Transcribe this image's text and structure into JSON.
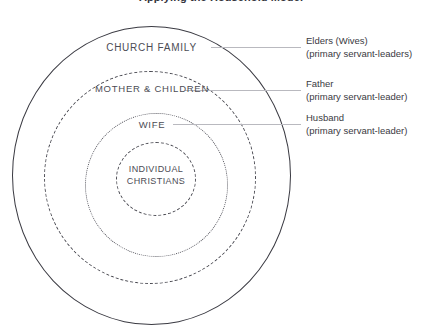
{
  "title": "Applying the Household Model",
  "diagram": {
    "type": "concentric-circles",
    "rings": [
      {
        "id": "church-family",
        "label": "CHURCH FAMILY",
        "stroke": "solid",
        "color": "#3a3a42",
        "level": 1
      },
      {
        "id": "mother-children",
        "label": "MOTHER & CHILDREN",
        "stroke": "dashed",
        "color": "#4a4a52",
        "level": 2
      },
      {
        "id": "wife",
        "label": "WIFE",
        "stroke": "dotted",
        "color": "#55555d",
        "level": 3
      },
      {
        "id": "individual-christians",
        "label": "INDIVIDUAL CHRISTIANS",
        "stroke": "dashed",
        "color": "#4a4a52",
        "level": 4
      }
    ],
    "annotations": [
      {
        "id": "elders",
        "title": "Elders (Wives)",
        "subtitle": "(primary servant-leaders)",
        "points_to": "church-family"
      },
      {
        "id": "father",
        "title": "Father",
        "subtitle": "(primary servant-leader)",
        "points_to": "mother-children"
      },
      {
        "id": "husband",
        "title": "Husband",
        "subtitle": "(primary servant-leader)",
        "points_to": "wife"
      }
    ],
    "leader_line_color": "#b9b9bf",
    "background": "#ffffff",
    "text_color": "#3a3a42"
  }
}
